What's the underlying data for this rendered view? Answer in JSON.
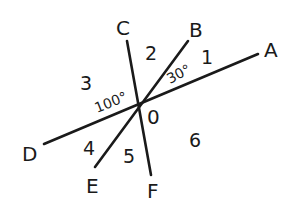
{
  "diagram": {
    "center": {
      "label": "0",
      "x": 139,
      "y": 104
    },
    "lines": [
      {
        "name": "line-AD",
        "from": "A",
        "to": "D"
      },
      {
        "name": "line-BE",
        "from": "B",
        "to": "E"
      },
      {
        "name": "line-CF",
        "from": "C",
        "to": "F"
      }
    ],
    "points": {
      "A": {
        "label": "A",
        "x": 258,
        "y": 54
      },
      "B": {
        "label": "B",
        "x": 188,
        "y": 41
      },
      "C": {
        "label": "C",
        "x": 127,
        "y": 41
      },
      "D": {
        "label": "D",
        "x": 44,
        "y": 144
      },
      "E": {
        "label": "E",
        "x": 95,
        "y": 167
      },
      "F": {
        "label": "F",
        "x": 151,
        "y": 175
      }
    },
    "regions": [
      "1",
      "2",
      "3",
      "4",
      "5",
      "6"
    ],
    "angles": {
      "AOB": "30°",
      "COD": "100°"
    },
    "stroke_color": "#1a1a1a",
    "background": "#ffffff"
  }
}
